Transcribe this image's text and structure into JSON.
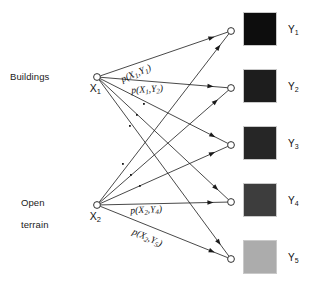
{
  "figure": {
    "type": "bipartite-graph-diagram",
    "background_color": "#ffffff",
    "line_color": "#1a1a1a"
  },
  "source_nodes": [
    {
      "id": "X1",
      "symbol": "X",
      "subscript": "1",
      "class_label": "Buildings",
      "x": 97,
      "y": 77
    },
    {
      "id": "X2",
      "symbol": "X",
      "subscript": "2",
      "class_label": "Open\nterrain",
      "x": 97,
      "y": 205
    }
  ],
  "target_nodes": [
    {
      "id": "Y1",
      "symbol": "Y",
      "subscript": "1",
      "x": 231,
      "y": 31
    },
    {
      "id": "Y2",
      "symbol": "Y",
      "subscript": "2",
      "x": 231,
      "y": 88
    },
    {
      "id": "Y3",
      "symbol": "Y",
      "subscript": "3",
      "x": 231,
      "y": 145
    },
    {
      "id": "Y4",
      "symbol": "Y",
      "subscript": "4",
      "x": 231,
      "y": 202
    },
    {
      "id": "Y5",
      "symbol": "Y",
      "subscript": "5",
      "x": 231,
      "y": 259
    }
  ],
  "class_labels": [
    {
      "name": "buildings-label",
      "text": "Buildings",
      "x": 10,
      "y": 71
    },
    {
      "name": "open-terrain-label",
      "line1": "Open",
      "line2": "terrain",
      "x": 10,
      "y": 192
    }
  ],
  "edge_captions": [
    {
      "name": "caption-x1y1",
      "text": "p(X",
      "sub1": "1",
      "mid": ",Y",
      "sub2": "1",
      "close": ")",
      "x": 113,
      "y": 68,
      "rotate": -23
    },
    {
      "name": "caption-x1y2",
      "text": "p(X",
      "sub1": "1",
      "mid": ",Y",
      "sub2": "2",
      "close": ")",
      "x": 122,
      "y": 76,
      "rotate": -4
    },
    {
      "name": "caption-x2y4",
      "text": "p(X",
      "sub1": "2",
      "mid": ",Y",
      "sub2": "4",
      "close": ")",
      "x": 121,
      "y": 196,
      "rotate": -3
    },
    {
      "name": "caption-x2y5",
      "text": "p(X",
      "sub1": "2",
      "mid": ",Y",
      "sub2": "5",
      "close": ")",
      "x": 124,
      "y": 212,
      "rotate": 24
    }
  ],
  "ellipsis_dots": {
    "upper": [
      [
        143,
        103
      ],
      [
        136,
        114
      ],
      [
        129,
        125
      ]
    ],
    "lower": [
      [
        122,
        163
      ],
      [
        130,
        174
      ],
      [
        139,
        185
      ]
    ]
  },
  "patches": [
    {
      "name": "patch-y1",
      "label": "Y",
      "subscript": "1",
      "x": 244,
      "y": 13,
      "color": "#0d0d0d",
      "border": "#c9c9c9",
      "label_x": 288,
      "label_y": 24
    },
    {
      "name": "patch-y2",
      "label": "Y",
      "subscript": "2",
      "x": 244,
      "y": 70,
      "color": "#1d1d1d",
      "border": "#c9c9c9",
      "label_x": 288,
      "label_y": 81
    },
    {
      "name": "patch-y3",
      "label": "Y",
      "subscript": "3",
      "x": 244,
      "y": 127,
      "color": "#262626",
      "border": "#c9c9c9",
      "label_x": 288,
      "label_y": 138
    },
    {
      "name": "patch-y4",
      "label": "Y",
      "subscript": "4",
      "x": 244,
      "y": 184,
      "color": "#3d3d3d",
      "border": "#c9c9c9",
      "label_x": 288,
      "label_y": 195
    },
    {
      "name": "patch-y5",
      "label": "Y",
      "subscript": "5",
      "x": 244,
      "y": 241,
      "color": "#acacac",
      "border": "#c9c9c9",
      "label_x": 288,
      "label_y": 252
    }
  ],
  "edges": [
    {
      "from": "X1",
      "to": "Y1"
    },
    {
      "from": "X1",
      "to": "Y2"
    },
    {
      "from": "X1",
      "to": "Y3"
    },
    {
      "from": "X1",
      "to": "Y4"
    },
    {
      "from": "X1",
      "to": "Y5"
    },
    {
      "from": "X2",
      "to": "Y1"
    },
    {
      "from": "X2",
      "to": "Y2"
    },
    {
      "from": "X2",
      "to": "Y3"
    },
    {
      "from": "X2",
      "to": "Y4"
    },
    {
      "from": "X2",
      "to": "Y5"
    }
  ]
}
